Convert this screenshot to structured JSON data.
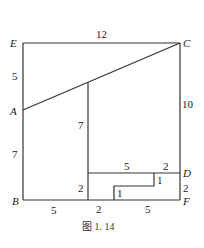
{
  "diagram": {
    "points": {
      "E": "E",
      "C": "C",
      "A": "A",
      "B": "B",
      "D": "D",
      "F": "F"
    },
    "lengths": {
      "EC": "12",
      "EA": "5",
      "AB": "7",
      "CF": "10",
      "inner_vertical": "7",
      "inner_small_left": "2",
      "B_left_segment": "5",
      "bottom_mid": "2",
      "bottom_right": "5",
      "top_step": "5",
      "top_right": "2",
      "DF": "2",
      "step_right": "1",
      "step_left": "1"
    },
    "caption": "图 1. 14"
  }
}
